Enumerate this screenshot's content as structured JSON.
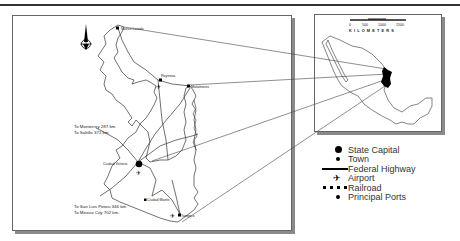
{
  "main_map": {
    "cities": {
      "nuevo_laredo": "Nuevo Laredo",
      "reynosa": "Reynosa",
      "matamoros": "Matamoros",
      "ciudad_victoria": "Ciudad Victoria",
      "ciudad_mante": "Ciudad Mante",
      "tampico": "Tampico"
    },
    "distances": {
      "monterrey": "To Monterrey 287 km.",
      "saltillo": "To Saltillo 372 km.",
      "san_luis_potosi": "To San Luis Potosi 346 km.",
      "mexico_city": "To Mexico City 702 km."
    },
    "north_arrow": "north-arrow-icon"
  },
  "inset_map": {
    "scale_ticks": [
      "0",
      "500",
      "1000",
      "1500"
    ],
    "scale_unit": "KILOMETERS"
  },
  "legend": {
    "items": [
      {
        "symbol": "state-capital",
        "label": "State Capital"
      },
      {
        "symbol": "town",
        "label": "Town"
      },
      {
        "symbol": "federal-highway",
        "label": "Federal Highway"
      },
      {
        "symbol": "airport",
        "label": "Airport"
      },
      {
        "symbol": "railroad",
        "label": "Railroad"
      },
      {
        "symbol": "principal-port",
        "label": "Principal Ports"
      }
    ]
  },
  "colors": {
    "line": "#333333",
    "fill_state": "#000000",
    "frame_shadow": "#8a8a8a"
  }
}
